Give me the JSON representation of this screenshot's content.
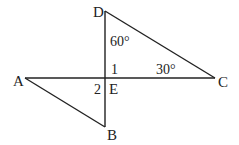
{
  "diagram": {
    "points": {
      "A": {
        "label": "A",
        "x": 25,
        "y": 78
      },
      "B": {
        "label": "B",
        "x": 105,
        "y": 127
      },
      "C": {
        "label": "C",
        "x": 215,
        "y": 78
      },
      "D": {
        "label": "D",
        "x": 105,
        "y": 11
      },
      "E": {
        "label": "E",
        "x": 105,
        "y": 78
      }
    },
    "segments": [
      "DB",
      "AC",
      "DC",
      "AB"
    ],
    "angle_labels": {
      "angle_D": "60°",
      "angle_C": "30°",
      "angle_1": "1",
      "angle_2": "2"
    },
    "colors": {
      "stroke": "#222222",
      "text": "#222222"
    }
  }
}
